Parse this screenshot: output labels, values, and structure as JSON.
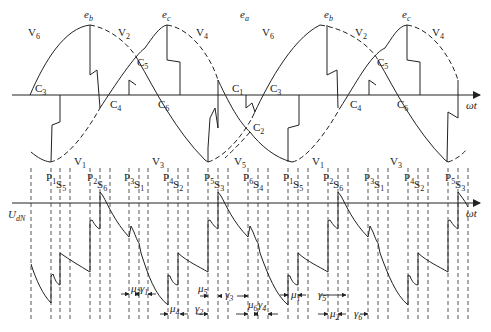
{
  "top_panel": {
    "axis_label": "ωt",
    "emf_labels": [
      {
        "text": "e",
        "sub": "b",
        "x": 84,
        "y": 18
      },
      {
        "text": "e",
        "sub": "c",
        "x": 162,
        "y": 18
      },
      {
        "text": "e",
        "sub": "a",
        "x": 240,
        "y": 18
      },
      {
        "text": "e",
        "sub": "b",
        "x": 324,
        "y": 18
      },
      {
        "text": "e",
        "sub": "c",
        "x": 402,
        "y": 18
      }
    ],
    "voltage_labels_top": [
      {
        "text": "V",
        "sub": "6",
        "x": 28,
        "y": 36
      },
      {
        "text": "V",
        "sub": "2",
        "x": 118,
        "y": 36
      },
      {
        "text": "V",
        "sub": "4",
        "x": 196,
        "y": 36
      },
      {
        "text": "V",
        "sub": "6",
        "x": 262,
        "y": 36
      },
      {
        "text": "V",
        "sub": "2",
        "x": 355,
        "y": 36
      },
      {
        "text": "V",
        "sub": "4",
        "x": 432,
        "y": 36
      }
    ],
    "voltage_labels_bottom": [
      {
        "text": "V",
        "sub": "1",
        "x": 74,
        "y": 165
      },
      {
        "text": "V",
        "sub": "3",
        "x": 152,
        "y": 165
      },
      {
        "text": "V",
        "sub": "5",
        "x": 234,
        "y": 165
      },
      {
        "text": "V",
        "sub": "1",
        "x": 312,
        "y": 165
      },
      {
        "text": "V",
        "sub": "3",
        "x": 390,
        "y": 165
      }
    ],
    "commutation_labels": [
      {
        "text": "C",
        "sub": "3",
        "x": 35,
        "y": 92
      },
      {
        "text": "C",
        "sub": "5",
        "x": 137,
        "y": 66
      },
      {
        "text": "C",
        "sub": "4",
        "x": 110,
        "y": 108
      },
      {
        "text": "C",
        "sub": "6",
        "x": 158,
        "y": 108
      },
      {
        "text": "C",
        "sub": "1",
        "x": 232,
        "y": 92
      },
      {
        "text": "C",
        "sub": "2",
        "x": 253,
        "y": 131
      },
      {
        "text": "C",
        "sub": "3",
        "x": 270,
        "y": 92
      },
      {
        "text": "C",
        "sub": "4",
        "x": 350,
        "y": 108
      },
      {
        "text": "C",
        "sub": "5",
        "x": 377,
        "y": 66
      },
      {
        "text": "C",
        "sub": "6",
        "x": 397,
        "y": 108
      }
    ]
  },
  "bottom_panel": {
    "axis_label": "ωt",
    "y_label": "U",
    "y_label_sub": "dN",
    "pulse_labels": [
      {
        "text": "P",
        "sub": "1",
        "x": 46,
        "y": 181
      },
      {
        "text": "S",
        "sub": "5",
        "x": 56,
        "y": 188
      },
      {
        "text": "P",
        "sub": "2",
        "x": 87,
        "y": 181
      },
      {
        "text": "S",
        "sub": "6",
        "x": 97,
        "y": 188
      },
      {
        "text": "P",
        "sub": "3",
        "x": 124,
        "y": 181
      },
      {
        "text": "S",
        "sub": "1",
        "x": 134,
        "y": 188
      },
      {
        "text": "P",
        "sub": "4",
        "x": 163,
        "y": 181
      },
      {
        "text": "S",
        "sub": "2",
        "x": 173,
        "y": 188
      },
      {
        "text": "P",
        "sub": "5",
        "x": 204,
        "y": 181
      },
      {
        "text": "S",
        "sub": "3",
        "x": 214,
        "y": 188
      },
      {
        "text": "P",
        "sub": "6",
        "x": 243,
        "y": 181
      },
      {
        "text": "S",
        "sub": "4",
        "x": 253,
        "y": 188
      },
      {
        "text": "P",
        "sub": "1",
        "x": 283,
        "y": 181
      },
      {
        "text": "S",
        "sub": "5",
        "x": 293,
        "y": 188
      },
      {
        "text": "P",
        "sub": "2",
        "x": 323,
        "y": 181
      },
      {
        "text": "S",
        "sub": "6",
        "x": 333,
        "y": 188
      },
      {
        "text": "P",
        "sub": "3",
        "x": 364,
        "y": 181
      },
      {
        "text": "S",
        "sub": "1",
        "x": 374,
        "y": 188
      },
      {
        "text": "P",
        "sub": "4",
        "x": 404,
        "y": 181
      },
      {
        "text": "S",
        "sub": "2",
        "x": 414,
        "y": 188
      },
      {
        "text": "P",
        "sub": "5",
        "x": 445,
        "y": 181
      },
      {
        "text": "S",
        "sub": "3",
        "x": 455,
        "y": 188
      }
    ],
    "interval_labels": [
      {
        "text": "μ",
        "sub": "3",
        "x": 131,
        "y": 292
      },
      {
        "text": "γ",
        "sub": "1",
        "x": 140,
        "y": 292
      },
      {
        "text": "μ",
        "sub": "4",
        "x": 170,
        "y": 312
      },
      {
        "text": "μ",
        "sub": "5",
        "x": 198,
        "y": 292
      },
      {
        "text": "γ",
        "sub": "2",
        "x": 195,
        "y": 312
      },
      {
        "text": "γ",
        "sub": "3",
        "x": 225,
        "y": 298
      },
      {
        "text": "μ",
        "sub": "6",
        "x": 248,
        "y": 308
      },
      {
        "text": "γ",
        "sub": "4",
        "x": 258,
        "y": 308
      },
      {
        "text": "μ",
        "sub": "1",
        "x": 291,
        "y": 298
      },
      {
        "text": "γ",
        "sub": "5",
        "x": 318,
        "y": 298
      },
      {
        "text": "μ",
        "sub": "2",
        "x": 330,
        "y": 317
      },
      {
        "text": "γ",
        "sub": "6",
        "x": 354,
        "y": 317
      }
    ]
  },
  "colors": {
    "line": "#222222",
    "dashed": "#444444",
    "background": "#ffffff"
  }
}
